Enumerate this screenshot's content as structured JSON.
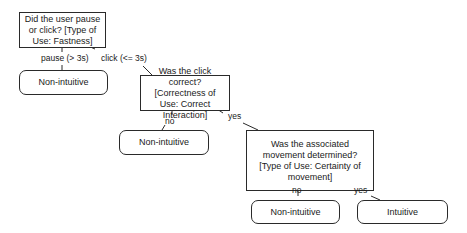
{
  "diagram": {
    "type": "decision-tree",
    "colors": {
      "stroke": "#2a2a2a",
      "background": "#ffffff",
      "text": "#1a1a1a"
    },
    "decisions": [
      {
        "id": "q1",
        "text": "Did the user pause or click? [Type of Use: Fastness]"
      },
      {
        "id": "q2",
        "text": "Was the click correct? [Correctness of Use: Correct Interaction]"
      },
      {
        "id": "q3",
        "text": "Was the associated movement determined? [Type of Use: Certainty of movement]"
      }
    ],
    "outcomes": [
      {
        "id": "t1",
        "text": "Non-intuitive"
      },
      {
        "id": "t2",
        "text": "Non-intuitive"
      },
      {
        "id": "t3",
        "text": "Non-intuitive"
      },
      {
        "id": "t4",
        "text": "Intuitive"
      }
    ],
    "edges": [
      {
        "from": "q1",
        "to": "t1",
        "label": "pause (> 3s)"
      },
      {
        "from": "q1",
        "to": "q2",
        "label": "click (<= 3s)"
      },
      {
        "from": "q2",
        "to": "t2",
        "label": "no"
      },
      {
        "from": "q2",
        "to": "q3",
        "label": "yes"
      },
      {
        "from": "q3",
        "to": "t3",
        "label": "no"
      },
      {
        "from": "q3",
        "to": "t4",
        "label": "yes"
      }
    ]
  }
}
